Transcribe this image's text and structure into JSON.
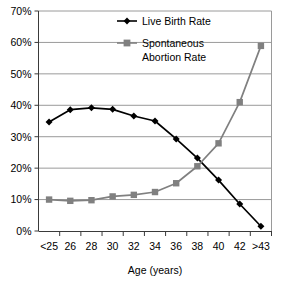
{
  "chart_data": {
    "type": "line",
    "title": "",
    "xlabel": "Age (years)",
    "ylabel": "",
    "categories": [
      "<25",
      "26",
      "28",
      "30",
      "32",
      "34",
      "36",
      "38",
      "40",
      "42",
      ">43"
    ],
    "ylim": [
      0,
      70
    ],
    "ytick_labels": [
      "0%",
      "10%",
      "20%",
      "30%",
      "40%",
      "50%",
      "60%",
      "70%"
    ],
    "ytick_values": [
      0,
      10,
      20,
      30,
      40,
      50,
      60,
      70
    ],
    "grid": true,
    "grid_axis": "y",
    "legend_position": "top-center",
    "series": [
      {
        "name": "Live Birth Rate",
        "color": "#000000",
        "marker": "diamond",
        "values": [
          34.7,
          38.6,
          39.2,
          38.7,
          36.6,
          35.0,
          29.3,
          23.2,
          16.2,
          8.6,
          1.5
        ]
      },
      {
        "name": "Spontaneous Abortion Rate",
        "color": "#808080",
        "marker": "square",
        "values": [
          10.0,
          9.6,
          9.8,
          11.0,
          11.5,
          12.4,
          15.2,
          20.6,
          27.9,
          41.0,
          58.9
        ]
      }
    ]
  },
  "legend": {
    "entries": [
      {
        "label": "Live Birth Rate"
      },
      {
        "label": "Spontaneous",
        "label2": "Abortion Rate"
      }
    ]
  },
  "axis": {
    "x_title": "Age (years)"
  }
}
